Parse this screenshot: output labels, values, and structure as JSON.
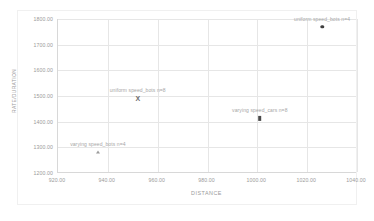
{
  "chart_data": {
    "type": "scatter",
    "title": "",
    "xlabel": "DISTANCE",
    "ylabel": "RATE/DURATION",
    "xlim": [
      920.0,
      1040.0
    ],
    "ylim": [
      1200.0,
      1800.0
    ],
    "grid": true,
    "legend_position": "none",
    "xticks": [
      "920.00",
      "940.00",
      "960.00",
      "980.00",
      "1000.00",
      "1020.00",
      "1040.00"
    ],
    "yticks": [
      "1800.00",
      "1700.00",
      "1600.00",
      "1500.00",
      "1400.00",
      "1300.00",
      "1200.00"
    ],
    "points": [
      {
        "label": "uniform speed_bots n=4",
        "x": 1026.0,
        "y": 1769.0,
        "marker": "circle",
        "color": "#3f3f3f"
      },
      {
        "label": "uniform speed_bots n=8",
        "x": 952.0,
        "y": 1493.0,
        "marker": "x",
        "color": "#6b6b6b"
      },
      {
        "label": "varying speed_cars n=8",
        "x": 1001.0,
        "y": 1413.0,
        "marker": "square",
        "color": "#4a4a4a"
      },
      {
        "label": "varying speed_bots n=4",
        "x": 936.0,
        "y": 1281.0,
        "marker": "triangle",
        "color": "#9c9c9c"
      }
    ]
  },
  "colors": {
    "grid": "#e6e6e6",
    "axis": "#d8d8d8",
    "text": "#9a9a9a",
    "background": "#ffffff"
  }
}
